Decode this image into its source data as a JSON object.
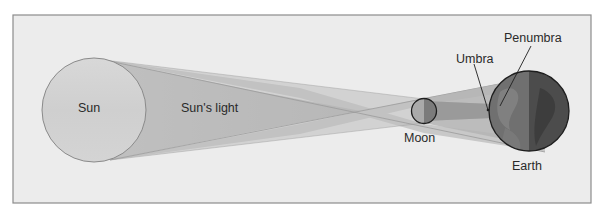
{
  "diagram": {
    "labels": {
      "sun": "Sun",
      "suns_light": "Sun's light",
      "moon": "Moon",
      "earth": "Earth",
      "umbra": "Umbra",
      "penumbra": "Penumbra"
    },
    "colors": {
      "frame_fill": "#ececec",
      "frame_border": "#8c8c8c",
      "sun_fill": "#d2d2d2",
      "beam_outer": "#c9c9c9",
      "beam_inner": "#b3b3b3",
      "moon_light": "#a9a9a9",
      "moon_dark": "#7a7a7a",
      "earth_light": "#6e6e6e",
      "earth_dark": "#4a4a4a",
      "text": "#2a2a2a"
    }
  }
}
